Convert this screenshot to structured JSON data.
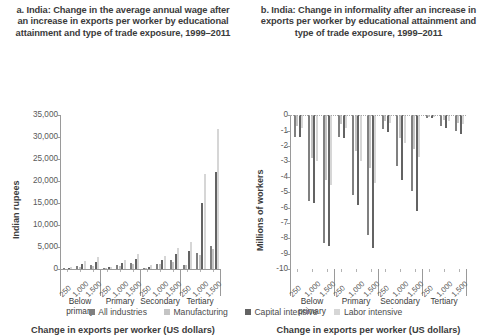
{
  "panels": {
    "left": {
      "title": "a. India: Change in the average annual wage after an increase in exports per worker by educational attainment and type of trade exposure, 1999–2011",
      "ylabel": "Indian rupees",
      "xaxis_title": "Change in exports per worker (US dollars)"
    },
    "right": {
      "title": "b. India: Change in informality after an increase in exports per worker by educational attainment and type of trade exposure, 1999–2011",
      "ylabel": "Millions of workers",
      "xaxis_title": "Change in exports per worker (US dollars)"
    }
  },
  "legend": {
    "items": [
      {
        "label": "All industries",
        "color": "#808080"
      },
      {
        "label": "Manufacturing",
        "color": "#c4c4c4"
      },
      {
        "label": "Capital intensive",
        "color": "#636363"
      },
      {
        "label": "Labor intensive",
        "color": "#d6d6d6"
      }
    ]
  },
  "groups": [
    "Below primary",
    "Primary",
    "Secondary",
    "Tertiary"
  ],
  "exposure_ticks": [
    "250",
    "1,000",
    "1,500"
  ],
  "chart_data": [
    {
      "type": "bar",
      "panel": "a",
      "title": "a. India: Change in the average annual wage after an increase in exports per worker by educational attainment and type of trade exposure, 1999–2011",
      "xlabel": "Change in exports per worker (US dollars)",
      "ylabel": "Indian rupees",
      "ylim": [
        0,
        35000
      ],
      "yticks": [
        "0",
        "5,000",
        "10,000",
        "15,000",
        "20,000",
        "25,000",
        "30,000",
        "35,000"
      ],
      "grid": false,
      "legend_position": "bottom",
      "groups": [
        "Below primary",
        "Primary",
        "Secondary",
        "Tertiary"
      ],
      "subcategories": [
        "250",
        "1,000",
        "1,500"
      ],
      "series": [
        {
          "name": "All industries",
          "color": "#808080",
          "values": [
            200,
            700,
            1000,
            250,
            900,
            1400,
            350,
            1300,
            2000,
            1000,
            3600,
            5300
          ]
        },
        {
          "name": "Manufacturing",
          "color": "#c4c4c4",
          "values": [
            150,
            500,
            750,
            200,
            700,
            1100,
            300,
            1100,
            1700,
            900,
            3200,
            4700
          ]
        },
        {
          "name": "Capital intensive",
          "color": "#636363",
          "values": [
            300,
            1100,
            1700,
            400,
            1500,
            2300,
            600,
            2200,
            3400,
            4200,
            15100,
            22000
          ]
        },
        {
          "name": "Labor intensive",
          "color": "#d6d6d6",
          "values": [
            500,
            1800,
            2700,
            600,
            2200,
            3400,
            850,
            3100,
            4800,
            6200,
            21700,
            31800
          ]
        }
      ]
    },
    {
      "type": "bar",
      "panel": "b",
      "title": "b. India: Change in informality after an increase in exports per worker by educational attainment and type of trade exposure, 1999–2011",
      "xlabel": "Change in exports per worker (US dollars)",
      "ylabel": "Millions of workers",
      "ylim": [
        -10,
        0
      ],
      "yticks": [
        "0",
        "-1",
        "-2",
        "-3",
        "-4",
        "-5",
        "-6",
        "-7",
        "-8",
        "-9",
        "-10"
      ],
      "grid": false,
      "legend_position": "bottom",
      "groups": [
        "Below primary",
        "Primary",
        "Secondary",
        "Tertiary"
      ],
      "subcategories": [
        "250",
        "1,000",
        "1,500"
      ],
      "series": [
        {
          "name": "All industries",
          "color": "#808080",
          "values": [
            -1.4,
            -5.6,
            -8.3,
            -1.4,
            -5.2,
            -7.8,
            -0.9,
            -3.3,
            -4.9,
            -0.2,
            -0.7,
            -1.0
          ]
        },
        {
          "name": "Manufacturing",
          "color": "#c4c4c4",
          "values": [
            -0.7,
            -2.8,
            -4.2,
            -0.6,
            -2.3,
            -3.4,
            -0.4,
            -1.5,
            -2.2,
            -0.1,
            -0.3,
            -0.5
          ]
        },
        {
          "name": "Capital intensive",
          "color": "#636363",
          "values": [
            -1.4,
            -5.7,
            -8.5,
            -1.5,
            -5.8,
            -8.6,
            -1.1,
            -4.2,
            -6.2,
            -0.2,
            -0.8,
            -1.2
          ]
        },
        {
          "name": "Labor intensive",
          "color": "#d6d6d6",
          "values": [
            -0.8,
            -3.0,
            -4.5,
            -0.8,
            -3.0,
            -4.4,
            -0.5,
            -1.8,
            -2.7,
            -0.1,
            -0.4,
            -0.6
          ]
        }
      ]
    }
  ]
}
